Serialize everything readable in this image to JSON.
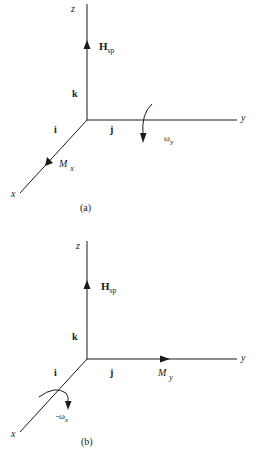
{
  "figure": {
    "panels": [
      {
        "id": "a",
        "caption": "(a)",
        "axes": {
          "z": "z",
          "y": "y",
          "x": "x"
        },
        "unit_vectors": {
          "k": "k",
          "i": "i",
          "j": "j"
        },
        "spin_momentum": {
          "symbol": "H",
          "subscript": "sp"
        },
        "moment": {
          "symbol": "M",
          "subscript": "x",
          "direction": "along +x axis"
        },
        "rate": {
          "symbol": "ω",
          "subscript": "y",
          "direction": "rotation about y axis"
        }
      },
      {
        "id": "b",
        "caption": "(b)",
        "axes": {
          "z": "z",
          "y": "y",
          "x": "x"
        },
        "unit_vectors": {
          "k": "k",
          "i": "i",
          "j": "j"
        },
        "spin_momentum": {
          "symbol": "H",
          "subscript": "sp"
        },
        "moment": {
          "symbol": "M",
          "subscript": "y",
          "direction": "along +y axis"
        },
        "rate": {
          "symbol": "-ω",
          "subscript": "x",
          "direction": "rotation about x axis"
        }
      }
    ],
    "colors": {
      "line": "#1a1a1a",
      "background": "#ffffff"
    }
  }
}
